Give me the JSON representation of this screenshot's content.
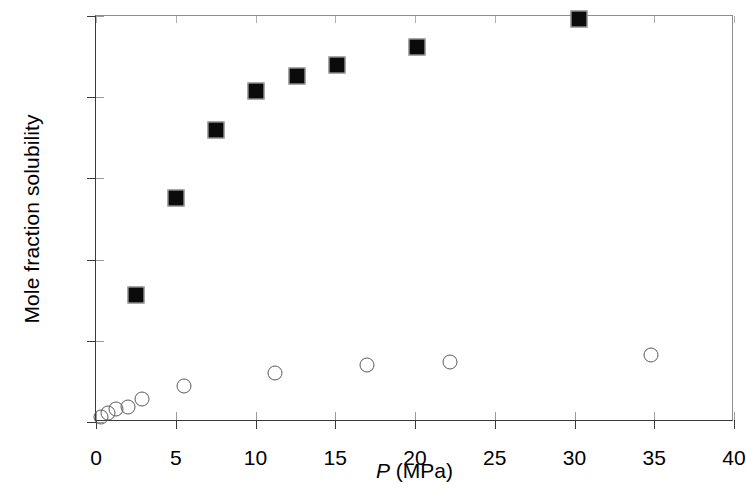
{
  "chart_data": {
    "type": "scatter",
    "title": "",
    "xlabel": "P (MPa)",
    "xlabel_italic_part": "P",
    "xlabel_rest": " (MPa)",
    "ylabel": "Mole fraction solubility",
    "xlim": [
      0,
      40
    ],
    "ylim": [
      0,
      0.025
    ],
    "xticks": [
      0,
      5,
      10,
      15,
      20,
      25,
      30,
      35,
      40
    ],
    "xtick_labels": [
      "0",
      "5",
      "10",
      "15",
      "20",
      "25",
      "30",
      "35",
      "40"
    ],
    "yticks": [
      0,
      0.005,
      0.01,
      0.015,
      0.02,
      0.025
    ],
    "ytick_labels": [
      "0",
      "0.005",
      "0.01",
      "0.015",
      "0.02",
      "0.025"
    ],
    "grid": false,
    "legend": false,
    "legend_position": "none",
    "series": [
      {
        "name": "filled-squares",
        "marker": "filled-square",
        "marker_color": "#0b0b0b",
        "points": [
          {
            "x": 2.5,
            "y": 0.0078
          },
          {
            "x": 5.0,
            "y": 0.0138
          },
          {
            "x": 7.5,
            "y": 0.018
          },
          {
            "x": 10.0,
            "y": 0.0204
          },
          {
            "x": 12.6,
            "y": 0.0213
          },
          {
            "x": 15.1,
            "y": 0.022
          },
          {
            "x": 20.1,
            "y": 0.0231
          },
          {
            "x": 30.3,
            "y": 0.0248
          }
        ]
      },
      {
        "name": "open-circles",
        "marker": "open-circle",
        "marker_color": "#5a5a5a",
        "points": [
          {
            "x": 0.3,
            "y": 0.0003
          },
          {
            "x": 0.75,
            "y": 0.00055
          },
          {
            "x": 1.25,
            "y": 0.0008
          },
          {
            "x": 2.0,
            "y": 0.0009
          },
          {
            "x": 2.9,
            "y": 0.0014
          },
          {
            "x": 5.5,
            "y": 0.0022
          },
          {
            "x": 11.2,
            "y": 0.003
          },
          {
            "x": 17.0,
            "y": 0.00348
          },
          {
            "x": 22.2,
            "y": 0.0037
          },
          {
            "x": 34.8,
            "y": 0.0041
          }
        ]
      }
    ]
  }
}
